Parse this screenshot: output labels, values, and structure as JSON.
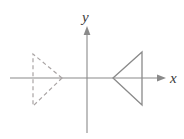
{
  "figure": {
    "title": "",
    "background_color": "#ffffff",
    "axes": {
      "x_axis": {
        "label": "x",
        "label_x": 172,
        "label_y": 82,
        "line_y": 78,
        "line_x_start": 10,
        "line_x_end": 163,
        "arrow": "right",
        "color": "#8a8a8a"
      },
      "y_axis": {
        "label": "y",
        "label_x": 87,
        "label_y": 20,
        "line_x": 87,
        "line_y_start": 28,
        "line_y_end": 133,
        "arrow": "up",
        "color": "#8a8a8a"
      }
    },
    "shapes": [
      {
        "name": "solid-triangle",
        "style": "solid",
        "stroke_color": "#8a8a8a",
        "stroke_width": 1.3,
        "fill": "none",
        "points": "113,78 142,52 142,105"
      },
      {
        "name": "dashed-triangle",
        "style": "dashed",
        "stroke_color": "#a9a4a4",
        "stroke_width": 1.2,
        "dash_pattern": "4,3",
        "fill": "none",
        "points": "62,78 33,54 33,106"
      }
    ]
  }
}
